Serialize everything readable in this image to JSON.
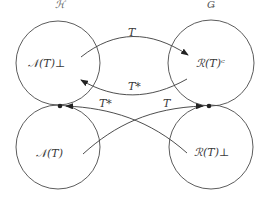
{
  "spaces": {
    "left": "ℋ",
    "right": "Ǥ"
  },
  "nodes": [
    {
      "id": "null-perp",
      "label": "𝒩(T)⊥"
    },
    {
      "id": "range-closure",
      "label": "ℛ(T)ᶜ"
    },
    {
      "id": "null",
      "label": "𝒩(T)"
    },
    {
      "id": "range-perp",
      "label": "ℛ(T)⊥"
    }
  ],
  "arrows": {
    "top_forward": "T",
    "top_back": "T*",
    "cross_adjoint": "T*",
    "cross_forward": "T"
  },
  "colors": {
    "stroke": "#4a4a4a",
    "text": "#3a3a3a"
  }
}
